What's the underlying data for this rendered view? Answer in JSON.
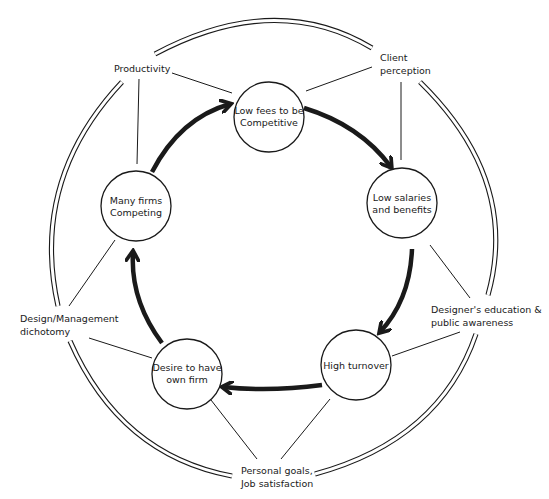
{
  "diagram": {
    "colors": {
      "background": "#ffffff",
      "ink": "#1a1a1a"
    },
    "cycle_nodes": [
      {
        "id": "low-fees",
        "lines": [
          "Low fees to be",
          "Competitive"
        ]
      },
      {
        "id": "low-salaries",
        "lines": [
          "Low salaries",
          "and benefits"
        ]
      },
      {
        "id": "high-turnover",
        "lines": [
          "High turnover"
        ]
      },
      {
        "id": "desire-own-firm",
        "lines": [
          "Desire to have",
          "own firm"
        ]
      },
      {
        "id": "many-firms",
        "lines": [
          "Many firms",
          "Competing"
        ]
      }
    ],
    "outer_factors": [
      {
        "id": "productivity",
        "lines": [
          "Productivity"
        ]
      },
      {
        "id": "client-perception",
        "lines": [
          "Client",
          "perception"
        ]
      },
      {
        "id": "designers-education",
        "lines": [
          "Designer's education &",
          "public awareness"
        ]
      },
      {
        "id": "personal-goals",
        "lines": [
          "Personal goals,",
          "Job satisfaction"
        ]
      },
      {
        "id": "design-management",
        "lines": [
          "Design/Management",
          "dichotomy"
        ]
      }
    ],
    "cycle_flow": [
      "Low fees to be Competitive",
      "Low salaries and benefits",
      "High turnover",
      "Desire to have own firm",
      "Many firms Competing",
      "Low fees to be Competitive"
    ]
  }
}
